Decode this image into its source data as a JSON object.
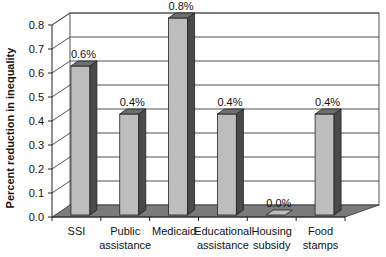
{
  "chart_data": {
    "type": "bar",
    "style": "3d-column",
    "title": "",
    "xlabel": "",
    "ylabel": "Percent reduction in inequality",
    "ylim": [
      0,
      0.8
    ],
    "yticks": [
      "0.0",
      "0.1",
      "0.2",
      "0.3",
      "0.4",
      "0.5",
      "0.6",
      "0.7",
      "0.8"
    ],
    "grid": true,
    "categories": [
      [
        "SSI"
      ],
      [
        "Public",
        "assistance"
      ],
      [
        "Medicaid"
      ],
      [
        "Educational",
        "assistance"
      ],
      [
        "Housing",
        "subsidy"
      ],
      [
        "Food",
        "stamps"
      ]
    ],
    "values": [
      0.6,
      0.4,
      0.8,
      0.4,
      0.0,
      0.4
    ],
    "data_labels": [
      "0.6%",
      "0.4%",
      "0.8%",
      "0.4%",
      "0.0%",
      "0.4%"
    ],
    "colors": {
      "bar_front": "#bdbdbd",
      "bar_side": "#4a4a4a",
      "bar_top": "#6e6e6e",
      "floor": "#7a7a7a",
      "grid": "#555555"
    }
  }
}
